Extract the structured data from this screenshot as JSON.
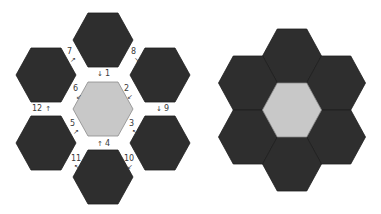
{
  "colors": {
    "dark_hex": "#2e2e2e",
    "dark_hex_stroke": "#1e1e1e",
    "center_hex": "#c8c8c8",
    "center_hex_stroke": "#8a8a8a",
    "label": "#3a3a3a",
    "background": "#ffffff"
  },
  "left_diagram": {
    "description": "exploded hexagon layout with numbered seam order",
    "hex_size": {
      "w": 60,
      "h": 54
    },
    "center": {
      "cx": 103,
      "cy": 109,
      "fill": "light"
    },
    "petals": [
      {
        "name": "top",
        "cx": 103,
        "cy": 40
      },
      {
        "name": "upper-left",
        "cx": 46,
        "cy": 75
      },
      {
        "name": "upper-right",
        "cx": 160,
        "cy": 75
      },
      {
        "name": "lower-left",
        "cx": 46,
        "cy": 143
      },
      {
        "name": "lower-right",
        "cx": 160,
        "cy": 143
      },
      {
        "name": "bottom",
        "cx": 103,
        "cy": 177
      }
    ],
    "labels": [
      {
        "num": "1",
        "arrow": "↓",
        "x": 97,
        "y": 70,
        "arrow_first": true
      },
      {
        "num": "2",
        "arrow": "↙",
        "x": 124,
        "y": 85
      },
      {
        "num": "3",
        "arrow": "↖",
        "x": 129,
        "y": 120
      },
      {
        "num": "4",
        "arrow": "↑",
        "x": 97,
        "y": 140,
        "arrow_first": true
      },
      {
        "num": "5",
        "arrow": "↗",
        "x": 70,
        "y": 120
      },
      {
        "num": "6",
        "arrow": "↙",
        "x": 73,
        "y": 85
      },
      {
        "num": "7",
        "arrow": "↗",
        "x": 67,
        "y": 48
      },
      {
        "num": "8",
        "arrow": "↘",
        "x": 131,
        "y": 48
      },
      {
        "num": "9",
        "arrow": "↓",
        "x": 156,
        "y": 105,
        "arrow_first": true
      },
      {
        "num": "10",
        "arrow": "↙",
        "x": 124,
        "y": 155
      },
      {
        "num": "11",
        "arrow": "↖",
        "x": 71,
        "y": 155
      },
      {
        "num": "12",
        "arrow": "↑",
        "x": 32,
        "y": 105
      }
    ]
  },
  "right_diagram": {
    "description": "assembled hexagon flower (grandmother's flower garden)",
    "hex_size": {
      "w": 59,
      "h": 54
    },
    "center": {
      "cx": 292,
      "cy": 110,
      "fill": "light"
    },
    "petals": [
      {
        "name": "top",
        "cx": 292,
        "cy": 56
      },
      {
        "name": "upper-left",
        "cx": 248,
        "cy": 83
      },
      {
        "name": "upper-right",
        "cx": 336,
        "cy": 83
      },
      {
        "name": "lower-left",
        "cx": 248,
        "cy": 137
      },
      {
        "name": "lower-right",
        "cx": 336,
        "cy": 137
      },
      {
        "name": "bottom",
        "cx": 292,
        "cy": 164
      }
    ]
  }
}
